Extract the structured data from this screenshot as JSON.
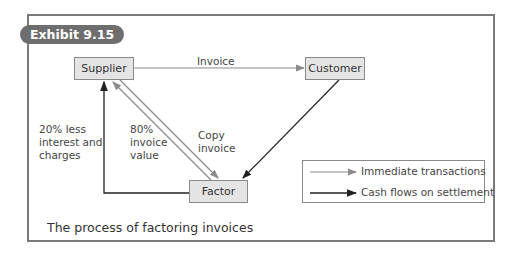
{
  "exhibit": {
    "label": "Exhibit 9.15"
  },
  "nodes": {
    "supplier": "Supplier",
    "customer": "Customer",
    "factor": "Factor"
  },
  "edges": {
    "invoice": "Invoice",
    "copy_invoice": [
      "Copy",
      "invoice"
    ],
    "eighty_percent": [
      "80%",
      "invoice",
      "value"
    ],
    "twenty_percent": [
      "20% less",
      "interest and",
      "charges"
    ]
  },
  "legend": {
    "immediate": "Immediate transactions",
    "settlement": "Cash flows on settlement"
  },
  "caption": "The process of factoring invoices",
  "colors": {
    "immediate_arrow": "#8c8c8c",
    "settlement_arrow": "#222222",
    "node_fill": "#e4e4e4",
    "pill": "#6e6e6e",
    "frame": "#7a7a7a"
  }
}
